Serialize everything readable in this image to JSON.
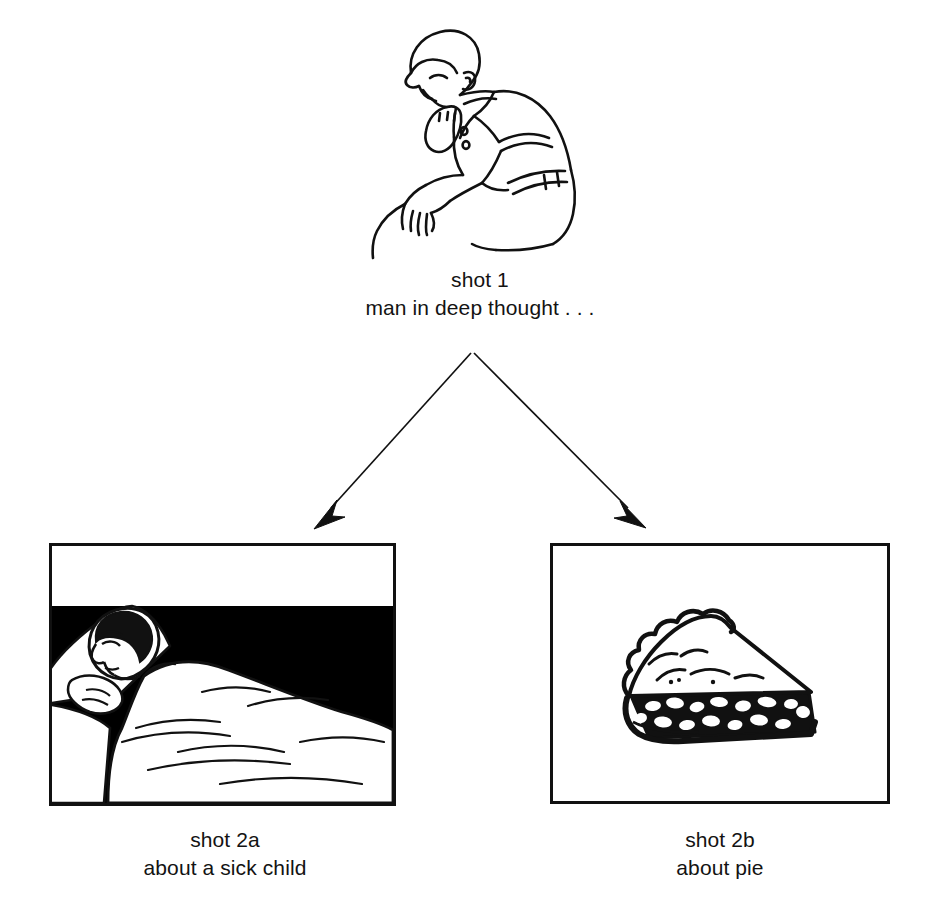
{
  "document": {
    "kind": "storyboard-branch-diagram",
    "background_color": "#ffffff",
    "ink_color": "#111111"
  },
  "nodes": {
    "shot1": {
      "label": "shot 1",
      "description": "man in deep thought . . .",
      "illustration": "thinking-man-line-drawing",
      "illustration_alt": "Line drawing of a seated man bent forward, chin resting on his fist, elbow on knee, wearing a short-sleeved polo shirt and belt"
    },
    "shot2a": {
      "label": "shot 2a",
      "description": "about a sick child",
      "illustration": "sick-child-in-bed-line-drawing",
      "illustration_alt": "Framed panel: a child asleep in bed under a blanket on a white pillow, against a solid black darkened room background"
    },
    "shot2b": {
      "label": "shot 2b",
      "description": "about pie",
      "illustration": "slice-of-pie-line-drawing",
      "illustration_alt": "Framed panel: a wedge-shaped slice of pie with a pale top crust and a dark filling speckled with light fruit pieces"
    }
  },
  "connectors": [
    {
      "name": "arrow-to-shot2a",
      "from": "shot1",
      "to": "shot2a",
      "direction": "down-left",
      "head": "solid-triangle"
    },
    {
      "name": "arrow-to-shot2b",
      "from": "shot1",
      "to": "shot2b",
      "direction": "down-right",
      "head": "solid-triangle"
    }
  ]
}
